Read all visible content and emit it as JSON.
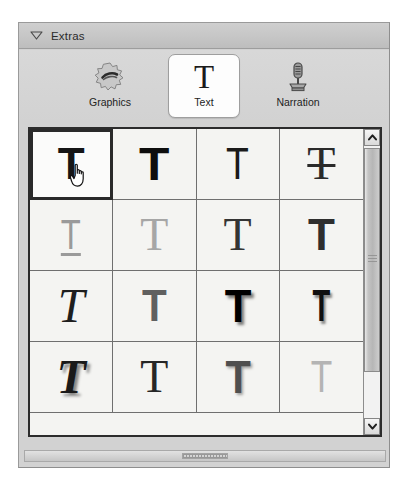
{
  "panel": {
    "title": "Extras",
    "disclosure_icon": "triangle-down-icon",
    "disclosure_state": "expanded"
  },
  "tabs": [
    {
      "id": "graphics",
      "label": "Graphics",
      "icon": "starburst-icon",
      "selected": false
    },
    {
      "id": "text",
      "label": "Text",
      "icon": "letter-t-icon",
      "selected": true
    },
    {
      "id": "narration",
      "label": "Narration",
      "icon": "microphone-icon",
      "selected": false
    }
  ],
  "grid": {
    "columns": 4,
    "selected_index": 0,
    "cursor_cell_index": 0,
    "cursor_icon": "pointing-hand-cursor",
    "items": [
      {
        "glyph": "T",
        "name": "style-plain-bold-sans",
        "family": "g-sans",
        "size": 44,
        "weight": "700",
        "color": "#151515",
        "italic": false,
        "underline": false,
        "strike": false,
        "shadow": "none",
        "scaleX": 1.0
      },
      {
        "glyph": "T",
        "name": "style-heavy-sans",
        "family": "g-sans",
        "size": 46,
        "weight": "700",
        "color": "#0d0d0d",
        "italic": false,
        "underline": false,
        "strike": false,
        "shadow": "none",
        "scaleX": 1.08
      },
      {
        "glyph": "T",
        "name": "style-thin-sans",
        "family": "g-sans",
        "size": 44,
        "weight": "400",
        "color": "#1a1a1a",
        "italic": false,
        "underline": false,
        "strike": false,
        "shadow": "none",
        "scaleX": 0.85
      },
      {
        "glyph": "T",
        "name": "style-serif-strikethrough",
        "family": "g-serif",
        "size": 46,
        "weight": "400",
        "color": "#2a2a2a",
        "italic": false,
        "underline": false,
        "strike": true,
        "shadow": "none",
        "scaleX": 1.0
      },
      {
        "glyph": "T",
        "name": "style-light-gray-underline",
        "family": "g-sans",
        "size": 42,
        "weight": "400",
        "color": "#9a9a9a",
        "italic": false,
        "underline": true,
        "strike": false,
        "shadow": "none",
        "scaleX": 0.78
      },
      {
        "glyph": "T",
        "name": "style-light-gray-serif",
        "family": "g-serif",
        "size": 46,
        "weight": "400",
        "color": "#a6a6a6",
        "italic": false,
        "underline": false,
        "strike": false,
        "shadow": "none",
        "scaleX": 1.0
      },
      {
        "glyph": "T",
        "name": "style-medium-serif",
        "family": "g-serif",
        "size": 46,
        "weight": "400",
        "color": "#343434",
        "italic": false,
        "underline": false,
        "strike": false,
        "shadow": "none",
        "scaleX": 1.0
      },
      {
        "glyph": "T",
        "name": "style-dark-slab",
        "family": "g-sans",
        "size": 44,
        "weight": "700",
        "color": "#2e2e2e",
        "italic": false,
        "underline": false,
        "strike": false,
        "shadow": "none",
        "scaleX": 1.0
      },
      {
        "glyph": "T",
        "name": "style-italic-serif",
        "family": "g-serif",
        "size": 48,
        "weight": "400",
        "color": "#1e1e1e",
        "italic": true,
        "underline": false,
        "strike": false,
        "shadow": "none",
        "scaleX": 1.0
      },
      {
        "glyph": "T",
        "name": "style-gray-slab",
        "family": "g-sans",
        "size": 44,
        "weight": "700",
        "color": "#606060",
        "italic": false,
        "underline": false,
        "strike": false,
        "shadow": "none",
        "scaleX": 0.92
      },
      {
        "glyph": "T",
        "name": "style-black-slab-shadow",
        "family": "g-sans",
        "size": 46,
        "weight": "700",
        "color": "#000000",
        "italic": false,
        "underline": false,
        "strike": false,
        "shadow": "3px 3px 3px rgba(0,0,0,0.5)",
        "scaleX": 0.95
      },
      {
        "glyph": "T",
        "name": "style-narrow-shadow",
        "family": "g-sans",
        "size": 44,
        "weight": "700",
        "color": "#101010",
        "italic": false,
        "underline": false,
        "strike": false,
        "shadow": "3px 3px 3px rgba(0,0,0,0.45)",
        "scaleX": 0.66
      },
      {
        "glyph": "T",
        "name": "style-italic-bold-shadow",
        "family": "g-serif",
        "size": 48,
        "weight": "700",
        "color": "#1a1a1a",
        "italic": true,
        "underline": false,
        "strike": false,
        "shadow": "3px 3px 3px rgba(0,0,0,0.45)",
        "scaleX": 1.0
      },
      {
        "glyph": "T",
        "name": "style-serif-plain",
        "family": "g-serif",
        "size": 46,
        "weight": "400",
        "color": "#262626",
        "italic": false,
        "underline": false,
        "strike": false,
        "shadow": "none",
        "scaleX": 1.0
      },
      {
        "glyph": "T",
        "name": "style-gray-bold-shadow",
        "family": "g-sans",
        "size": 46,
        "weight": "700",
        "color": "#4f4f4f",
        "italic": false,
        "underline": false,
        "strike": false,
        "shadow": "2px 2px 3px rgba(0,0,0,0.35)",
        "scaleX": 0.9
      },
      {
        "glyph": "T",
        "name": "style-light-outline",
        "family": "g-sans",
        "size": 44,
        "weight": "400",
        "color": "#b4b4b4",
        "italic": false,
        "underline": false,
        "strike": false,
        "shadow": "none",
        "scaleX": 0.8
      }
    ]
  },
  "scrollbar": {
    "up_icon": "chevron-up-icon",
    "down_icon": "chevron-down-icon",
    "grip_icon": "scrollbar-grip-icon",
    "orientation": "vertical"
  },
  "splitter": {
    "grip_icon": "resize-grip-icon",
    "orientation": "horizontal"
  },
  "colors": {
    "panel_bg": "#d2d2d2",
    "grid_bg": "#f4f4f2",
    "grid_border": "#2c2c2c",
    "selection_border": "#2a2a2a",
    "tab_selected_bg": "#fdfdfd"
  }
}
